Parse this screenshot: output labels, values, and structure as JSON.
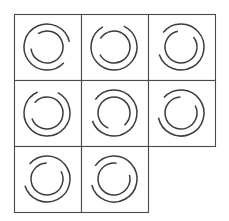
{
  "figure": {
    "type": "visual-analogy-matrix",
    "background_color": "#ffffff",
    "grid": {
      "rows": 3,
      "cols": 3,
      "origin_x": 14,
      "origin_y": 14,
      "cell_width": 67,
      "cell_height": 66,
      "border_color": "#4a4a4a",
      "border_width": 1.1,
      "missing_cells": [
        [
          2,
          2
        ]
      ]
    },
    "arc_style": {
      "stroke_color": "#3c3c3c",
      "stroke_width": 1.5,
      "outer_radius": 23,
      "inner_radius": 16
    }
  },
  "chart_data": {
    "type": "table",
    "xlabel": "",
    "ylabel": "",
    "categories": [
      "column-1",
      "column-2",
      "column-3"
    ],
    "row_labels": [
      "row-1",
      "row-2",
      "row-3"
    ],
    "cells": [
      {
        "id": "cell-r1c1",
        "row": 0,
        "col": 0,
        "present": true,
        "center_x": 47,
        "center_y": 47,
        "outer_ring": {
          "radius": 23,
          "gap_center_deg": 15,
          "gap_span_deg": 56
        },
        "inner_ring": {
          "radius": 16,
          "gap_center_deg": 205,
          "gap_span_deg": 62
        }
      },
      {
        "id": "cell-r1c2",
        "row": 0,
        "col": 1,
        "present": true,
        "center_x": 114,
        "center_y": 47,
        "outer_ring": {
          "radius": 23,
          "gap_center_deg": 268,
          "gap_span_deg": 54
        },
        "inner_ring": {
          "radius": 16,
          "gap_center_deg": 182,
          "gap_span_deg": 60
        }
      },
      {
        "id": "cell-r1c3",
        "row": 0,
        "col": 2,
        "present": true,
        "center_x": 181,
        "center_y": 47,
        "outer_ring": {
          "radius": 23,
          "gap_center_deg": 190,
          "gap_span_deg": 58
        },
        "inner_ring": {
          "radius": 16,
          "gap_center_deg": 290,
          "gap_span_deg": 62
        }
      },
      {
        "id": "cell-r2c1",
        "row": 1,
        "col": 0,
        "present": true,
        "center_x": 47,
        "center_y": 113,
        "outer_ring": {
          "radius": 23,
          "gap_center_deg": 272,
          "gap_span_deg": 52
        },
        "inner_ring": {
          "radius": 16,
          "gap_center_deg": 190,
          "gap_span_deg": 60
        }
      },
      {
        "id": "cell-r2c2",
        "row": 1,
        "col": 1,
        "present": true,
        "center_x": 114,
        "center_y": 113,
        "outer_ring": {
          "radius": 23,
          "gap_center_deg": 188,
          "gap_span_deg": 56
        },
        "inner_ring": {
          "radius": 16,
          "gap_center_deg": 80,
          "gap_span_deg": 62
        }
      },
      {
        "id": "cell-r2c3",
        "row": 1,
        "col": 2,
        "present": true,
        "center_x": 181,
        "center_y": 113,
        "outer_ring": {
          "radius": 23,
          "gap_center_deg": 195,
          "gap_span_deg": 54
        },
        "inner_ring": {
          "radius": 16,
          "gap_center_deg": 300,
          "gap_span_deg": 64
        }
      },
      {
        "id": "cell-r3c1",
        "row": 2,
        "col": 0,
        "present": true,
        "center_x": 47,
        "center_y": 179,
        "outer_ring": {
          "radius": 23,
          "gap_center_deg": 192,
          "gap_span_deg": 58
        },
        "inner_ring": {
          "radius": 16,
          "gap_center_deg": 300,
          "gap_span_deg": 62
        }
      },
      {
        "id": "cell-r3c2",
        "row": 2,
        "col": 1,
        "present": true,
        "center_x": 114,
        "center_y": 179,
        "outer_ring": {
          "radius": 23,
          "gap_center_deg": 190,
          "gap_span_deg": 50
        },
        "inner_ring": {
          "radius": 16,
          "gap_center_deg": 312,
          "gap_span_deg": 66
        }
      },
      {
        "id": "cell-r3c3",
        "row": 2,
        "col": 2,
        "present": false,
        "center_x": 181,
        "center_y": 179,
        "outer_ring": null,
        "inner_ring": null
      }
    ]
  }
}
